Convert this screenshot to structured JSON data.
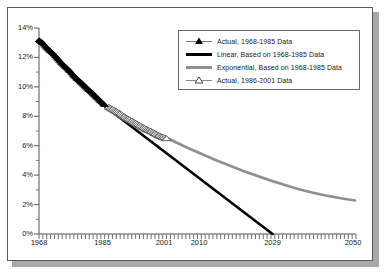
{
  "chart_data": {
    "type": "line",
    "title": "",
    "xlabel": "",
    "ylabel": "",
    "xlim": [
      1968,
      2050
    ],
    "ylim": [
      0,
      14
    ],
    "yunit": "%",
    "grid": false,
    "legend_position": "top-right",
    "ytick_labels": [
      "14%",
      "12%",
      "10%",
      "8%",
      "6%",
      "4%",
      "2%",
      "0%"
    ],
    "ytick_values": [
      14,
      12,
      10,
      8,
      6,
      4,
      2,
      0
    ],
    "xtick_labels": [
      "1968",
      "1985",
      "2001",
      "2010",
      "2029",
      "2050"
    ],
    "xtick_values": [
      1968,
      1985,
      2001,
      2010,
      2029,
      2050
    ],
    "series": [
      {
        "name": "Actual, 1968-1985 Data",
        "marker": "filled-triangle",
        "color": "#000000",
        "x": [
          1968,
          1969,
          1970,
          1971,
          1972,
          1973,
          1974,
          1975,
          1976,
          1977,
          1978,
          1979,
          1980,
          1981,
          1982,
          1983,
          1984,
          1985
        ],
        "values": [
          13.2,
          13.0,
          12.7,
          12.45,
          12.2,
          11.9,
          11.6,
          11.35,
          11.1,
          10.8,
          10.55,
          10.3,
          10.05,
          9.8,
          9.55,
          9.3,
          9.05,
          8.8
        ]
      },
      {
        "name": "Linear, Based on 1968-1985 Data",
        "marker": "none",
        "color": "#000000",
        "x": [
          1985,
          2029
        ],
        "values": [
          8.8,
          0.0
        ]
      },
      {
        "name": "Exponential, Based on 1968-1985 Data",
        "marker": "none",
        "color": "#8c8c8c",
        "x": [
          1985,
          1990,
          1995,
          2000,
          2005,
          2010,
          2015,
          2020,
          2025,
          2030,
          2035,
          2040,
          2045,
          2050
        ],
        "values": [
          8.8,
          7.9,
          7.1,
          6.4,
          5.75,
          5.2,
          4.7,
          4.25,
          3.85,
          3.5,
          3.2,
          3.0,
          2.85,
          2.7
        ]
      },
      {
        "name": "Actual, 1986-2001 Data",
        "marker": "open-triangle",
        "color": "#555555",
        "x": [
          1986,
          1987,
          1988,
          1989,
          1990,
          1991,
          1992,
          1993,
          1994,
          1995,
          1996,
          1997,
          1998,
          1999,
          2000,
          2001
        ],
        "values": [
          8.65,
          8.5,
          8.35,
          8.2,
          8.0,
          7.85,
          7.7,
          7.55,
          7.4,
          7.25,
          7.1,
          7.0,
          6.85,
          6.7,
          6.6,
          6.5
        ]
      }
    ]
  },
  "legend": {
    "items": [
      {
        "label": "Actual, 1968-1985 Data",
        "key": "filled-triangle-line-key"
      },
      {
        "label": "Linear, Based on 1968-1985 Data",
        "key": "thick-black-line-key"
      },
      {
        "label": "Exponential, Based on 1968-1985 Data",
        "key": "thick-gray-line-key"
      },
      {
        "label": "Actual, 1986-2001 Data",
        "key": "open-triangle-line-key"
      }
    ]
  },
  "axes": {
    "y": {
      "labels": [
        "14%",
        "12%",
        "10%",
        "8%",
        "6%",
        "4%",
        "2%",
        "0%"
      ]
    },
    "x": {
      "labels": [
        "1968",
        "1985",
        "2001",
        "2010",
        "2029",
        "2050"
      ]
    }
  }
}
